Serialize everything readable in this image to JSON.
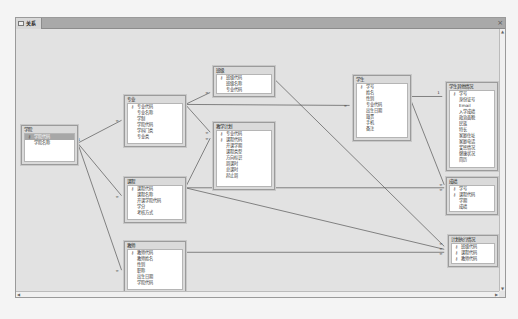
{
  "window": {
    "tab_label": "关系",
    "close_label": "×"
  },
  "tables": {
    "xueyuan": {
      "title": "学院",
      "fields": [
        {
          "name": "学院代码",
          "key": true,
          "selected": true
        },
        {
          "name": "学院名称",
          "key": false
        }
      ]
    },
    "zhuanye": {
      "title": "专业",
      "fields": [
        {
          "name": "专业代码",
          "key": true
        },
        {
          "name": "专业名称",
          "key": false
        },
        {
          "name": "学制",
          "key": false
        },
        {
          "name": "学院代码",
          "key": false
        },
        {
          "name": "学科门类",
          "key": false
        },
        {
          "name": "专业类",
          "key": false
        }
      ]
    },
    "banji": {
      "title": "班级",
      "fields": [
        {
          "name": "班级代码",
          "key": true
        },
        {
          "name": "班级名称",
          "key": false
        },
        {
          "name": "专业代码",
          "key": false
        }
      ]
    },
    "jiaoxuejihua": {
      "title": "教学计划",
      "fields": [
        {
          "name": "专业代码",
          "key": true
        },
        {
          "name": "课程代码",
          "key": true
        },
        {
          "name": "开课学期",
          "key": false
        },
        {
          "name": "课程类型",
          "key": false
        },
        {
          "name": "方向标识",
          "key": false
        },
        {
          "name": "周课时",
          "key": false
        },
        {
          "name": "总课时",
          "key": false
        },
        {
          "name": "起止周",
          "key": false
        }
      ]
    },
    "kecheng": {
      "title": "课程",
      "fields": [
        {
          "name": "课程代码",
          "key": true
        },
        {
          "name": "课程名称",
          "key": false
        },
        {
          "name": "开课学院代码",
          "key": false
        },
        {
          "name": "学分",
          "key": false
        },
        {
          "name": "考核方式",
          "key": false
        }
      ]
    },
    "jiaoshi": {
      "title": "教师",
      "fields": [
        {
          "name": "教师代码",
          "key": true
        },
        {
          "name": "教师姓名",
          "key": false
        },
        {
          "name": "性别",
          "key": false
        },
        {
          "name": "职称",
          "key": false
        },
        {
          "name": "出生日期",
          "key": false
        },
        {
          "name": "学院代码",
          "key": false
        }
      ]
    },
    "xuesheng": {
      "title": "学生",
      "fields": [
        {
          "name": "学号",
          "key": true
        },
        {
          "name": "姓名",
          "key": false
        },
        {
          "name": "性别",
          "key": false
        },
        {
          "name": "专业代码",
          "key": false
        },
        {
          "name": "出生日期",
          "key": false
        },
        {
          "name": "籍贯",
          "key": false
        },
        {
          "name": "手机",
          "key": false
        },
        {
          "name": "备注",
          "key": false
        }
      ]
    },
    "xueshengqita": {
      "title": "学生其他情况",
      "fields": [
        {
          "name": "学号",
          "key": true
        },
        {
          "name": "身份证号",
          "key": false
        },
        {
          "name": "Email",
          "key": false
        },
        {
          "name": "入学成绩",
          "key": false
        },
        {
          "name": "政治面貌",
          "key": false
        },
        {
          "name": "民族",
          "key": false
        },
        {
          "name": "特长",
          "key": false
        },
        {
          "name": "家庭住址",
          "key": false
        },
        {
          "name": "家庭电话",
          "key": false
        },
        {
          "name": "奖惩情况",
          "key": false
        },
        {
          "name": "健康状况",
          "key": false
        },
        {
          "name": "简历",
          "key": false
        }
      ]
    },
    "chengji": {
      "title": "成绩",
      "fields": [
        {
          "name": "学号",
          "key": true
        },
        {
          "name": "课程代码",
          "key": true
        },
        {
          "name": "学期",
          "key": false
        },
        {
          "name": "成绩",
          "key": false
        }
      ]
    },
    "jihuazhixing": {
      "title": "计划执行情况",
      "fields": [
        {
          "name": "班级代码",
          "key": true
        },
        {
          "name": "课程代码",
          "key": true
        },
        {
          "name": "教师代码",
          "key": true
        }
      ]
    }
  },
  "relationships": [
    {
      "from": "学院",
      "to": "专业",
      "one": "1",
      "many": "∞"
    },
    {
      "from": "学院",
      "to": "课程",
      "one": "1",
      "many": "∞"
    },
    {
      "from": "学院",
      "to": "教师",
      "one": "1",
      "many": "∞"
    },
    {
      "from": "专业",
      "to": "班级",
      "one": "1",
      "many": "∞"
    },
    {
      "from": "专业",
      "to": "教学计划",
      "one": "1",
      "many": "∞"
    },
    {
      "from": "专业",
      "to": "学生",
      "one": "1",
      "many": "∞"
    },
    {
      "from": "班级",
      "to": "计划执行情况",
      "one": "1",
      "many": "∞"
    },
    {
      "from": "课程",
      "to": "教学计划",
      "one": "1",
      "many": "∞"
    },
    {
      "from": "课程",
      "to": "成绩",
      "one": "1",
      "many": "∞"
    },
    {
      "from": "课程",
      "to": "计划执行情况",
      "one": "1",
      "many": "∞"
    },
    {
      "from": "学生",
      "to": "学生其他情况",
      "one": "1",
      "many": "1"
    },
    {
      "from": "学生",
      "to": "成绩",
      "one": "1",
      "many": "∞"
    },
    {
      "from": "教师",
      "to": "计划执行情况",
      "one": "1",
      "many": "∞"
    }
  ],
  "colors": {
    "canvas": "#e2e2e2",
    "tabbar": "#a9a9a9",
    "line": "#555555"
  }
}
